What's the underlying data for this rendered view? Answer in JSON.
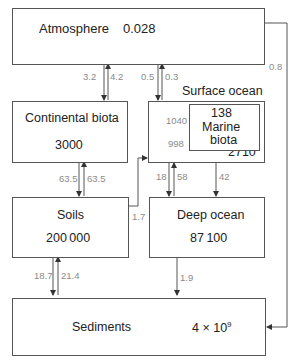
{
  "reservoirs": {
    "atmosphere": {
      "label": "Atmosphere",
      "value": "0.028"
    },
    "continental_biota": {
      "label": "Continental biota",
      "value": "3000"
    },
    "surface_ocean": {
      "label": "Surface ocean",
      "value": "2710"
    },
    "marine_biota": {
      "label_line1": "Marine",
      "label_line2": "biota",
      "value": "138"
    },
    "soils": {
      "label": "Soils",
      "value": "200 000"
    },
    "deep_ocean": {
      "label": "Deep ocean",
      "value": "87 100"
    },
    "sediments": {
      "label": "Sediments",
      "value_base": "4 × 10",
      "value_exp": "9"
    }
  },
  "fluxes": {
    "atm_to_cont": "3.2",
    "cont_to_atm": "4.2",
    "atm_to_surf": "0.5",
    "surf_to_atm": "0.3",
    "atm_to_sed": "0.8",
    "marine_to_surf": "1040",
    "surf_to_marine": "998",
    "cont_to_soil": "63.5",
    "soil_to_cont": "63.5",
    "soil_to_surf": "1.7",
    "surf_to_deep": "18",
    "deep_to_surf": "58",
    "surf_to_deep_2": "42",
    "soil_to_sed": "18.7",
    "sed_to_soil": "21.4",
    "deep_to_sed": "1.9"
  }
}
